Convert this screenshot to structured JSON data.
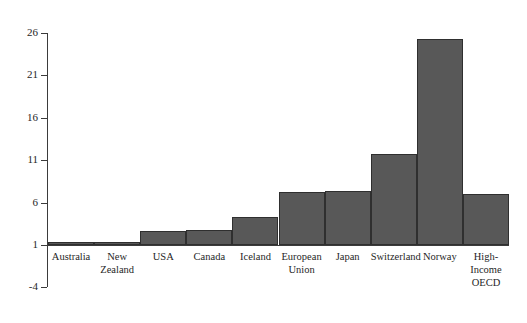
{
  "chart_data": {
    "type": "bar",
    "title": "",
    "subtitle": "",
    "xlabel": "",
    "ylabel": "",
    "categories": [
      "Australia",
      "New\nZealand",
      "USA",
      "Canada",
      "Iceland",
      "European\nUnion",
      "Japan",
      "Switzerland",
      "Norway",
      "High-\nIncome\nOECD"
    ],
    "values": [
      0.4,
      0.9,
      2.6,
      2.8,
      4.3,
      7.3,
      7.4,
      11.7,
      25.3,
      7.0
    ],
    "baseline": 1,
    "ylim": [
      -4,
      26
    ],
    "yticks": [
      26,
      21,
      16,
      11,
      6,
      1,
      -4
    ],
    "ytick_labels": [
      "26",
      "21",
      "16",
      "11",
      "6",
      "1",
      "-4"
    ],
    "grid": false,
    "legend": null,
    "legend_position": "none",
    "bar_color": "#585858",
    "bar_edge_color": "#2f2f2f",
    "axis_color": "#3b3b3b",
    "background_color": "#ffffff",
    "text_color": "#1f1f1f"
  }
}
